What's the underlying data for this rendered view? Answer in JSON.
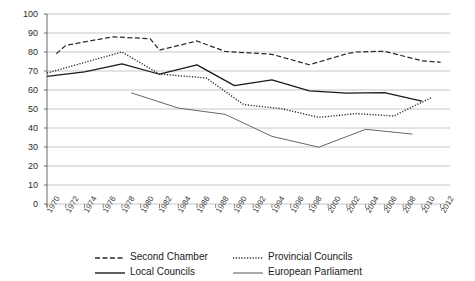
{
  "chart_data": {
    "type": "line",
    "title": "",
    "xlabel": "",
    "ylabel": "",
    "ylim": [
      0,
      100
    ],
    "ytick_step": 10,
    "yticks": [
      "100",
      "90",
      "80",
      "70",
      "60",
      "50",
      "40",
      "30",
      "20",
      "10",
      "0"
    ],
    "xlim": [
      1970,
      2013
    ],
    "xticks": [
      "1970",
      "1972",
      "1974",
      "1976",
      "1978",
      "1980",
      "1982",
      "1984",
      "1986",
      "1988",
      "1990",
      "1992",
      "1994",
      "1996",
      "1998",
      "2000",
      "2002",
      "2004",
      "2006",
      "2008",
      "2010",
      "2012"
    ],
    "grid": true,
    "legend_position": "bottom",
    "series": [
      {
        "name": "Second Chamber",
        "style": "dashed",
        "color": "#2b2b2b",
        "points": [
          [
            1971,
            79.1
          ],
          [
            1972,
            83.5
          ],
          [
            1977,
            88.0
          ],
          [
            1981,
            87.0
          ],
          [
            1982,
            81.0
          ],
          [
            1986,
            85.8
          ],
          [
            1989,
            80.3
          ],
          [
            1994,
            78.8
          ],
          [
            1998,
            73.3
          ],
          [
            2002,
            79.1
          ],
          [
            2003,
            80.0
          ],
          [
            2006,
            80.4
          ],
          [
            2010,
            75.4
          ],
          [
            2012,
            74.6
          ]
        ]
      },
      {
        "name": "Provincial Councils",
        "style": "dotted",
        "color": "#2b2b2b",
        "points": [
          [
            1970,
            68.9
          ],
          [
            1974,
            74.5
          ],
          [
            1978,
            80.0
          ],
          [
            1982,
            68.4
          ],
          [
            1987,
            66.3
          ],
          [
            1991,
            52.3
          ],
          [
            1995,
            50.2
          ],
          [
            1999,
            45.6
          ],
          [
            2003,
            47.6
          ],
          [
            2007,
            46.3
          ],
          [
            2011,
            56.0
          ]
        ]
      },
      {
        "name": "Local Councils",
        "style": "solid-thick",
        "color": "#1a1a1a",
        "points": [
          [
            1970,
            67.2
          ],
          [
            1974,
            69.5
          ],
          [
            1978,
            73.7
          ],
          [
            1982,
            68.3
          ],
          [
            1986,
            73.2
          ],
          [
            1990,
            62.3
          ],
          [
            1994,
            65.3
          ],
          [
            1998,
            59.5
          ],
          [
            2002,
            58.3
          ],
          [
            2006,
            58.6
          ],
          [
            2010,
            54.1
          ]
        ]
      },
      {
        "name": "European Parliament",
        "style": "solid-thin",
        "color": "#555555",
        "points": [
          [
            1979,
            58.5
          ],
          [
            1984,
            50.5
          ],
          [
            1989,
            47.2
          ],
          [
            1994,
            35.6
          ],
          [
            1999,
            29.9
          ],
          [
            2004,
            39.3
          ],
          [
            2009,
            36.8
          ]
        ]
      }
    ]
  }
}
